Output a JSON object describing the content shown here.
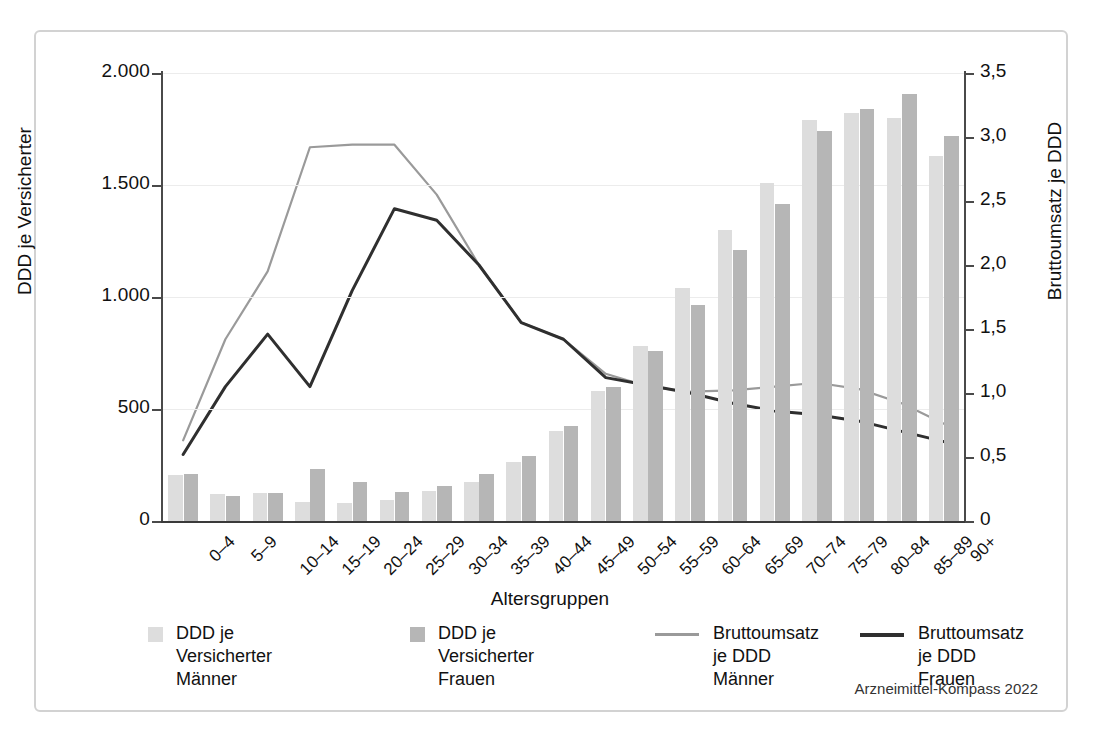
{
  "chart_data": {
    "type": "bar",
    "title": "",
    "subtitle": "",
    "xlabel": "Altersgruppen",
    "ylabel": "DDD je Versicherter",
    "y2label": "Bruttoumsatz je DDD",
    "ylim": [
      0,
      2000
    ],
    "y2lim": [
      0,
      3.5
    ],
    "yticks": [
      "0",
      "500",
      "1.000",
      "1.500",
      "2.000"
    ],
    "ytick_values": [
      0,
      500,
      1000,
      1500,
      2000
    ],
    "y2ticks": [
      "0",
      "0,5",
      "1,0",
      "1,5",
      "2,0",
      "2,5",
      "3,0",
      "3,5"
    ],
    "y2tick_values": [
      0,
      0.5,
      1.0,
      1.5,
      2.0,
      2.5,
      3.0,
      3.5
    ],
    "grid": true,
    "legend_position": "bottom",
    "categories": [
      "0–4",
      "5–9",
      "10–14",
      "15–19",
      "20–24",
      "25–29",
      "30–34",
      "35–39",
      "40–44",
      "45–49",
      "50–54",
      "55–59",
      "60–64",
      "65–69",
      "70–74",
      "75–79",
      "80–84",
      "85–89",
      "90+"
    ],
    "series": [
      {
        "name": "DDD je Versicherter Männer",
        "type": "bar",
        "axis": "left",
        "color": "#dddddd",
        "values": [
          205,
          120,
          125,
          85,
          80,
          95,
          135,
          175,
          265,
          400,
          580,
          780,
          1040,
          1300,
          1510,
          1790,
          1820,
          1800,
          1630
        ]
      },
      {
        "name": "DDD je Versicherter Frauen",
        "type": "bar",
        "axis": "left",
        "color": "#b6b6b6",
        "values": [
          210,
          110,
          125,
          230,
          175,
          130,
          155,
          210,
          290,
          425,
          600,
          760,
          965,
          1210,
          1415,
          1740,
          1840,
          1905,
          1720
        ]
      },
      {
        "name": "Bruttoumsatz je DDD Männer",
        "type": "line",
        "axis": "right",
        "color": "#9a9a9a",
        "values": [
          0.63,
          1.42,
          1.95,
          2.92,
          2.94,
          2.94,
          2.55,
          2.0,
          1.55,
          1.42,
          1.15,
          1.05,
          1.01,
          1.02,
          1.05,
          1.08,
          1.03,
          0.92,
          0.76
        ]
      },
      {
        "name": "Bruttoumsatz je DDD Frauen",
        "type": "line",
        "axis": "right",
        "color": "#2f2f2f",
        "values": [
          0.52,
          1.05,
          1.46,
          1.05,
          1.8,
          2.44,
          2.35,
          2.0,
          1.55,
          1.42,
          1.12,
          1.06,
          1.0,
          0.92,
          0.86,
          0.83,
          0.78,
          0.7,
          0.62
        ]
      }
    ]
  },
  "legend": {
    "items": [
      {
        "label": "DDD je Versicherter\nMänner",
        "marker": "swatch",
        "color": "#dddddd"
      },
      {
        "label": "DDD je Versicherter\nFrauen",
        "marker": "swatch",
        "color": "#b6b6b6"
      },
      {
        "label": "Bruttoumsatz\nje DDD Männer",
        "marker": "line",
        "color": "#9a9a9a"
      },
      {
        "label": "Bruttoumsatz\nje DDD Frauen",
        "marker": "line",
        "color": "#2f2f2f"
      }
    ]
  },
  "source": "Arzneimittel-Kompass 2022",
  "colors": {
    "bar_men": "#dddddd",
    "bar_women": "#b6b6b6",
    "line_men": "#9a9a9a",
    "line_women": "#2f2f2f",
    "frame": "#d2d2d2",
    "grid": "#ececec",
    "axis": "#4a4a4a"
  }
}
